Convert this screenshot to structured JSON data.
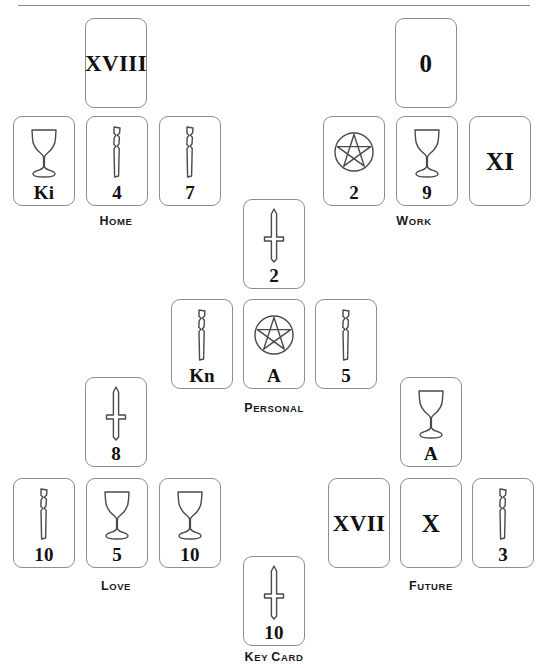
{
  "diagram": {
    "rule_color": "#8a8a8a",
    "card_border_color": "#8d8d8d",
    "ink_color": "#1a1a1a",
    "background": "#ffffff"
  },
  "groups": [
    {
      "id": "home",
      "label": "Home",
      "label_x": 116,
      "label_y": 216,
      "cards": [
        {
          "name": "home-top",
          "suit": "major",
          "rank": "XVIII",
          "x": 85,
          "y": 18
        },
        {
          "name": "home-left",
          "suit": "cups",
          "rank": "Ki",
          "x": 13,
          "y": 116
        },
        {
          "name": "home-middle",
          "suit": "wands",
          "rank": "4",
          "x": 86,
          "y": 116
        },
        {
          "name": "home-right",
          "suit": "wands",
          "rank": "7",
          "x": 159,
          "y": 116
        }
      ]
    },
    {
      "id": "work",
      "label": "Work",
      "label_x": 414,
      "label_y": 216,
      "cards": [
        {
          "name": "work-top",
          "suit": "major",
          "rank": "0",
          "x": 395,
          "y": 18
        },
        {
          "name": "work-left",
          "suit": "pentacles",
          "rank": "2",
          "x": 323,
          "y": 116
        },
        {
          "name": "work-middle",
          "suit": "cups",
          "rank": "9",
          "x": 396,
          "y": 116
        },
        {
          "name": "work-right",
          "suit": "major",
          "rank": "XI",
          "x": 469,
          "y": 116
        }
      ]
    },
    {
      "id": "personal",
      "label": "Personal",
      "label_x": 274,
      "label_y": 403,
      "cards": [
        {
          "name": "personal-top",
          "suit": "swords",
          "rank": "2",
          "x": 243,
          "y": 199
        },
        {
          "name": "personal-left",
          "suit": "wands",
          "rank": "Kn",
          "x": 171,
          "y": 299
        },
        {
          "name": "personal-middle",
          "suit": "pentacles",
          "rank": "A",
          "x": 243,
          "y": 299
        },
        {
          "name": "personal-right",
          "suit": "wands",
          "rank": "5",
          "x": 315,
          "y": 299
        }
      ]
    },
    {
      "id": "love",
      "label": "Love",
      "label_x": 116,
      "label_y": 581,
      "cards": [
        {
          "name": "love-top",
          "suit": "swords",
          "rank": "8",
          "x": 85,
          "y": 377
        },
        {
          "name": "love-left",
          "suit": "wands",
          "rank": "10",
          "x": 13,
          "y": 478
        },
        {
          "name": "love-middle",
          "suit": "cups",
          "rank": "5",
          "x": 86,
          "y": 478
        },
        {
          "name": "love-right",
          "suit": "cups",
          "rank": "10",
          "x": 159,
          "y": 478
        }
      ]
    },
    {
      "id": "future",
      "label": "Future",
      "label_x": 431,
      "label_y": 581,
      "cards": [
        {
          "name": "future-top",
          "suit": "cups",
          "rank": "A",
          "x": 400,
          "y": 377
        },
        {
          "name": "future-left",
          "suit": "major",
          "rank": "XVII",
          "x": 328,
          "y": 478
        },
        {
          "name": "future-middle",
          "suit": "major",
          "rank": "X",
          "x": 400,
          "y": 478
        },
        {
          "name": "future-right",
          "suit": "wands",
          "rank": "3",
          "x": 472,
          "y": 478
        }
      ]
    },
    {
      "id": "key-card",
      "label": "Key Card",
      "label_x": 274,
      "label_y": 652,
      "cards": [
        {
          "name": "key-card",
          "suit": "swords",
          "rank": "10",
          "x": 243,
          "y": 556
        }
      ]
    }
  ],
  "suit_icons": {
    "cups": "cup-icon",
    "wands": "wand-icon",
    "swords": "sword-icon",
    "pentacles": "pentacle-icon",
    "major": "major-arcana-icon"
  }
}
